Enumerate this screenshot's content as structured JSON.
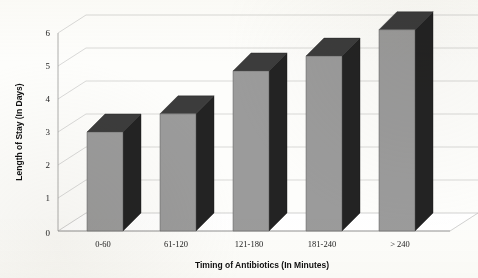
{
  "chart_data": {
    "type": "bar",
    "title": "",
    "subtitle": "",
    "xlabel": "Timing of Antibiotics (In Minutes)",
    "ylabel": "Length of Stay (In Days)",
    "categories": [
      "0-60",
      "61-120",
      "121-180",
      "181-240",
      "> 240"
    ],
    "values": [
      3.0,
      3.55,
      4.85,
      5.3,
      6.1
    ],
    "series": [
      {
        "name": "Length of Stay",
        "values": [
          3.0,
          3.55,
          4.85,
          5.3,
          6.1
        ]
      }
    ],
    "ylim": [
      0,
      6
    ],
    "xlim": null,
    "yticks": [
      0,
      1,
      2,
      3,
      4,
      5,
      6
    ],
    "ytick_labels": [
      "0",
      "1",
      "2",
      "3",
      "4",
      "5",
      "6"
    ],
    "grid": true,
    "grid_axis": "y",
    "legend": false,
    "legend_position": "none",
    "style": "3d-column",
    "annotations": []
  },
  "axes": {
    "y_title": "Length of Stay (In Days)",
    "x_title": "Timing of Antibiotics (In Minutes)",
    "y_ticks": [
      "0",
      "1",
      "2",
      "3",
      "4",
      "5",
      "6"
    ],
    "x_categories": [
      "0-60",
      "61-120",
      "121-180",
      "181-240",
      "> 240"
    ]
  },
  "colors": {
    "bar_front": "#9b9b9b",
    "bar_side": "#232323",
    "bar_top": "#3c3c3c",
    "gridline": "#c9c9c9",
    "axis": "#9a9a9a",
    "background": "#fdfdfb",
    "text": "#232323"
  }
}
